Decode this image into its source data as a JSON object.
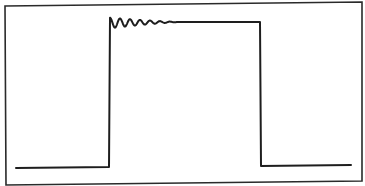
{
  "diagram": {
    "type": "waveform",
    "colors": {
      "background": "#ffffff",
      "stroke": "#1e1e1e",
      "frame": "#2a2a2a"
    },
    "frame": {
      "points": [
        [
          5,
          6
        ],
        [
          362,
          2
        ],
        [
          362,
          181
        ],
        [
          6,
          185
        ]
      ]
    },
    "waveform": {
      "low_level_y": 167,
      "high_level_y": 22,
      "rise_x": 110,
      "fall_x": 260,
      "start_x": 16,
      "end_x": 351,
      "ringing": {
        "start_x": 110,
        "end_x": 180,
        "cycles": 7,
        "initial_amplitude_px": 8,
        "damped": true
      }
    }
  }
}
